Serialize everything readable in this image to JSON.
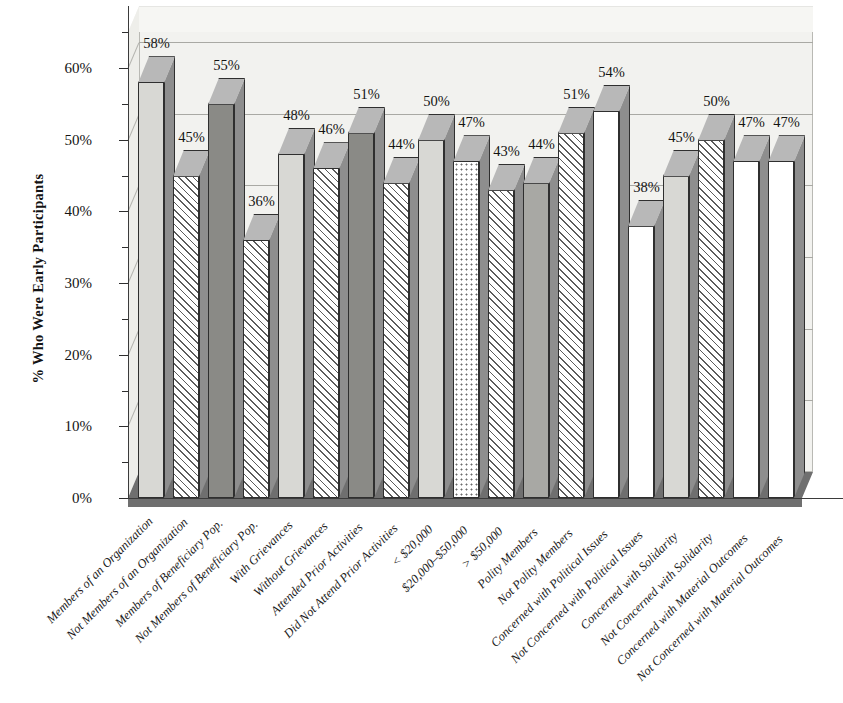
{
  "chart_data": {
    "type": "bar",
    "title": "",
    "subtitle": "",
    "xlabel": "",
    "ylabel": "% Who Were Early Participants",
    "ylim": [
      0,
      65
    ],
    "ytick_labels": [
      "0%",
      "10%",
      "20%",
      "30%",
      "40%",
      "50%",
      "60%"
    ],
    "ytick_values": [
      0,
      10,
      20,
      30,
      40,
      50,
      60
    ],
    "minor_tick_step": 5,
    "grid": true,
    "legend": "none",
    "categories": [
      "Members of an Organization",
      "Not Members of an Organization",
      "Members of Beneficiary Pop.",
      "Not Members of Beneficiary Pop.",
      "With Grievances",
      "Without Grievances",
      "Attended Prior Activities",
      "Did Not Attend Prior Activities",
      "< $20,000",
      "$20,000–$50,000",
      "> $50,000",
      "Polity Members",
      "Not Polity Members",
      "Concerned with Political Issues",
      "Not Concerned with Political Issues",
      "Concerned with Solidarity",
      "Not Concerned with Solidarity",
      "Concerned with Material Outcomes",
      "Not Concerned with Material Outcomes"
    ],
    "values": [
      58,
      45,
      55,
      36,
      48,
      46,
      51,
      44,
      50,
      47,
      43,
      44,
      51,
      54,
      38,
      45,
      50,
      47,
      47
    ],
    "value_labels": [
      "58%",
      "45%",
      "55%",
      "36%",
      "48%",
      "46%",
      "51%",
      "44%",
      "50%",
      "47%",
      "43%",
      "44%",
      "51%",
      "54%",
      "38%",
      "45%",
      "50%",
      "47%",
      "47%"
    ],
    "bar_styles": [
      "lightgray",
      "hatch",
      "darkgray",
      "hatch",
      "lightgray",
      "hatch",
      "darkgray",
      "hatch",
      "lightgray",
      "dots",
      "hatch",
      "gray",
      "hatch",
      "white",
      "white",
      "lightgray",
      "hatch",
      "white",
      "white"
    ]
  },
  "colors": {
    "light_gray": "#d8d8d4",
    "gray": "#a8a8a4",
    "dark_gray": "#8a8a86",
    "white": "#ffffff",
    "floor": "#6f6f6f",
    "backwall": "#f2f2ef",
    "gridline": "#a9a9a4",
    "text": "#141414"
  }
}
